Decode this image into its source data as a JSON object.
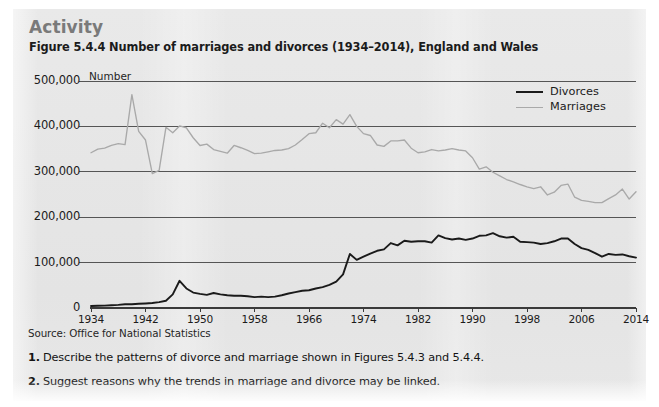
{
  "panel": {
    "activity_heading": "Activity",
    "figure_title": "Figure 5.4.4 Number of marriages and divorces (1934–2014), England and Wales",
    "source": "Source: Office for National Statistics",
    "questions": [
      {
        "number": "1.",
        "text": "Describe the patterns of divorce and marriage shown in Figures 5.4.3 and 5.4.4."
      },
      {
        "number": "2.",
        "text": "Suggest reasons why the trends in marriage and divorce may be linked."
      }
    ]
  },
  "colors": {
    "panel_background": "#e6e6e6",
    "divorces_line": "#1a1a1a",
    "marriages_line": "#a9a9a9",
    "gridline": "#555555",
    "heading": "#7a7a7a",
    "text": "#1b1b1b"
  },
  "chart_data": {
    "type": "line",
    "title": "Figure 5.4.4 Number of marriages and divorces (1934–2014), England and Wales",
    "subtitle": "",
    "xlabel": "",
    "ylabel": "Number",
    "y_unit_label": "Number",
    "xlim": [
      1934,
      2014
    ],
    "ylim": [
      0,
      500000
    ],
    "yticks": [
      0,
      100000,
      200000,
      300000,
      400000,
      500000
    ],
    "ytick_labels": [
      "0",
      "100,000",
      "200,000",
      "300,000",
      "400,000",
      "500,000"
    ],
    "xticks": [
      1934,
      1942,
      1950,
      1958,
      1966,
      1974,
      1982,
      1990,
      1998,
      2006,
      2014
    ],
    "xtick_labels": [
      "1934",
      "1942",
      "1950",
      "1958",
      "1966",
      "1974",
      "1982",
      "1990",
      "1998",
      "2006",
      "2014"
    ],
    "grid": true,
    "grid_axis": "y",
    "legend_position": "top-right",
    "legend": [
      "Divorces",
      "Marriages"
    ],
    "x": [
      1934,
      1935,
      1936,
      1937,
      1938,
      1939,
      1940,
      1941,
      1942,
      1943,
      1944,
      1945,
      1946,
      1947,
      1948,
      1949,
      1950,
      1951,
      1952,
      1953,
      1954,
      1955,
      1956,
      1957,
      1958,
      1959,
      1960,
      1961,
      1962,
      1963,
      1964,
      1965,
      1966,
      1967,
      1968,
      1969,
      1970,
      1971,
      1972,
      1973,
      1974,
      1975,
      1976,
      1977,
      1978,
      1979,
      1980,
      1981,
      1982,
      1983,
      1984,
      1985,
      1986,
      1987,
      1988,
      1989,
      1990,
      1991,
      1992,
      1993,
      1994,
      1995,
      1996,
      1997,
      1998,
      1999,
      2000,
      2001,
      2002,
      2003,
      2004,
      2005,
      2006,
      2007,
      2008,
      2009,
      2010,
      2011,
      2012,
      2013,
      2014
    ],
    "series": [
      {
        "name": "Marriages",
        "color": "#a9a9a9",
        "values": [
          342000,
          350000,
          352000,
          358000,
          362000,
          360000,
          470000,
          389000,
          370000,
          296000,
          303000,
          398000,
          386000,
          401000,
          397000,
          375000,
          358000,
          361000,
          349000,
          345000,
          341000,
          358000,
          353000,
          347000,
          340000,
          341000,
          344000,
          347000,
          348000,
          351000,
          359000,
          371000,
          384000,
          386000,
          407000,
          397000,
          415000,
          405000,
          426000,
          400000,
          384000,
          380000,
          359000,
          356000,
          368000,
          368000,
          370000,
          352000,
          342000,
          344000,
          349000,
          346000,
          348000,
          351000,
          348000,
          346000,
          331000,
          306000,
          311000,
          299000,
          291000,
          283000,
          278000,
          272000,
          267000,
          263000,
          267000,
          249000,
          255000,
          270000,
          273000,
          244000,
          237000,
          235000,
          232000,
          232000,
          241000,
          249000,
          262000,
          240000,
          256000
        ]
      },
      {
        "name": "Divorces",
        "color": "#1a1a1a",
        "values": [
          4300,
          4800,
          5200,
          6000,
          6900,
          8200,
          8400,
          9200,
          10000,
          11000,
          13000,
          16000,
          30000,
          60000,
          43000,
          34000,
          31000,
          29000,
          33000,
          30000,
          28000,
          27000,
          27000,
          26000,
          24000,
          25000,
          24000,
          25000,
          28000,
          32000,
          35000,
          38000,
          39000,
          43000,
          46000,
          51000,
          58000,
          74000,
          119000,
          106000,
          113000,
          120000,
          126000,
          129000,
          143000,
          138000,
          148000,
          146000,
          147000,
          147000,
          144000,
          160000,
          154000,
          151000,
          153000,
          150000,
          153000,
          159000,
          160000,
          165000,
          158000,
          155000,
          157000,
          146000,
          145000,
          144000,
          141000,
          143000,
          147000,
          153000,
          153000,
          141000,
          132000,
          128000,
          121000,
          113000,
          119000,
          117000,
          118000,
          114000,
          111000
        ]
      }
    ]
  }
}
